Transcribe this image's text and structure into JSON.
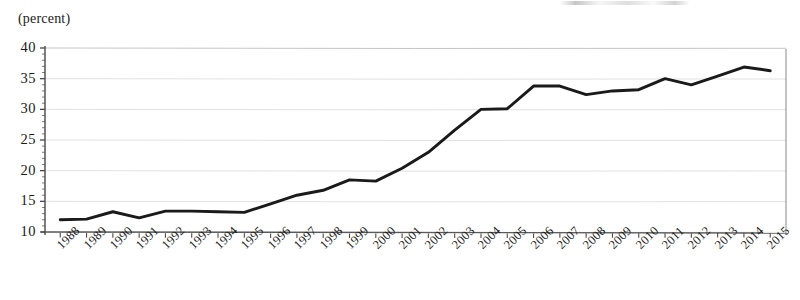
{
  "axis_unit_label": "(percent)",
  "chart_data": {
    "type": "line",
    "title": "",
    "subtitle": "",
    "xlabel": "",
    "ylabel": "(percent)",
    "ylim": [
      10,
      40
    ],
    "yticks": [
      10,
      15,
      20,
      25,
      30,
      35,
      40
    ],
    "ytick_labels": [
      "10",
      "15",
      "20",
      "25",
      "30",
      "35",
      "40"
    ],
    "grid": true,
    "grid_axis": "y",
    "legend": false,
    "legend_position": "none",
    "line_color": "#1a1a1a",
    "grid_color": "#bfbfbf",
    "axis_color": "#4a4a4a",
    "categories": [
      "1988",
      "1989",
      "1990",
      "1991",
      "1992",
      "1993",
      "1994",
      "1995",
      "1996",
      "1997",
      "1998",
      "1999",
      "2000",
      "2001",
      "2002",
      "2003",
      "2004",
      "2005",
      "2006",
      "2007",
      "2008",
      "2009",
      "2010",
      "2011",
      "2012",
      "2013",
      "2014",
      "2015"
    ],
    "values": [
      12.0,
      12.1,
      13.3,
      12.3,
      13.4,
      13.4,
      13.3,
      13.2,
      14.6,
      16.0,
      16.8,
      18.5,
      18.3,
      20.4,
      23.0,
      26.6,
      30.0,
      30.1,
      33.8,
      33.8,
      32.4,
      33.0,
      33.2,
      35.0,
      34.0,
      35.4,
      36.9,
      36.3
    ],
    "xtick_labels": [
      "1988",
      "1989",
      "1990",
      "1991",
      "1992",
      "1993",
      "1994",
      "1995",
      "1996",
      "1997",
      "1998",
      "1999",
      "2000",
      "2001",
      "2002",
      "2003",
      "2004",
      "2005",
      "2006",
      "2007",
      "2008",
      "2009",
      "2010",
      "2011",
      "2012",
      "2013",
      "2014",
      "2015"
    ]
  }
}
